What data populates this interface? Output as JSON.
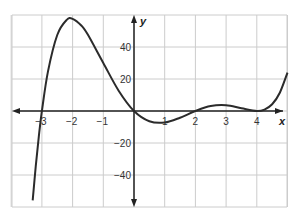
{
  "chart_data": {
    "type": "line",
    "title": "",
    "xlabel": "x",
    "ylabel": "y",
    "xlim": [
      -4,
      5
    ],
    "ylim": [
      -60,
      60
    ],
    "grid": true,
    "x_ticks": [
      -3,
      -2,
      -1,
      1,
      2,
      3,
      4
    ],
    "y_ticks": [
      -40,
      -20,
      20,
      40
    ],
    "x_tick_labels": [
      "−3",
      "−2",
      "−1",
      "1",
      "2",
      "3",
      "4"
    ],
    "y_tick_labels": [
      "−40",
      "−20",
      "20",
      "40"
    ],
    "series": [
      {
        "name": "f(x)",
        "x": [
          -3.3,
          -3.2,
          -3.1,
          -3.0,
          -2.8,
          -2.5,
          -2.2,
          -2.0,
          -1.7,
          -1.5,
          -1.0,
          -0.5,
          0,
          0.5,
          1.0,
          1.5,
          2.0,
          2.5,
          3.0,
          3.5,
          4.0,
          4.25,
          4.5,
          4.75,
          5.0
        ],
        "y": [
          -55.9,
          -34.5,
          -15.8,
          0,
          24.9,
          47.5,
          56.8,
          57.6,
          53.1,
          47.6,
          30.0,
          12.7,
          0,
          -6.4,
          -7.2,
          -4.2,
          0,
          3.1,
          3.6,
          1.7,
          0,
          0.9,
          4.2,
          11.4,
          24.0
        ]
      }
    ],
    "colors": {
      "curve": "#2b2b2b",
      "grid": "#cccccc",
      "axis": "#222222"
    }
  }
}
